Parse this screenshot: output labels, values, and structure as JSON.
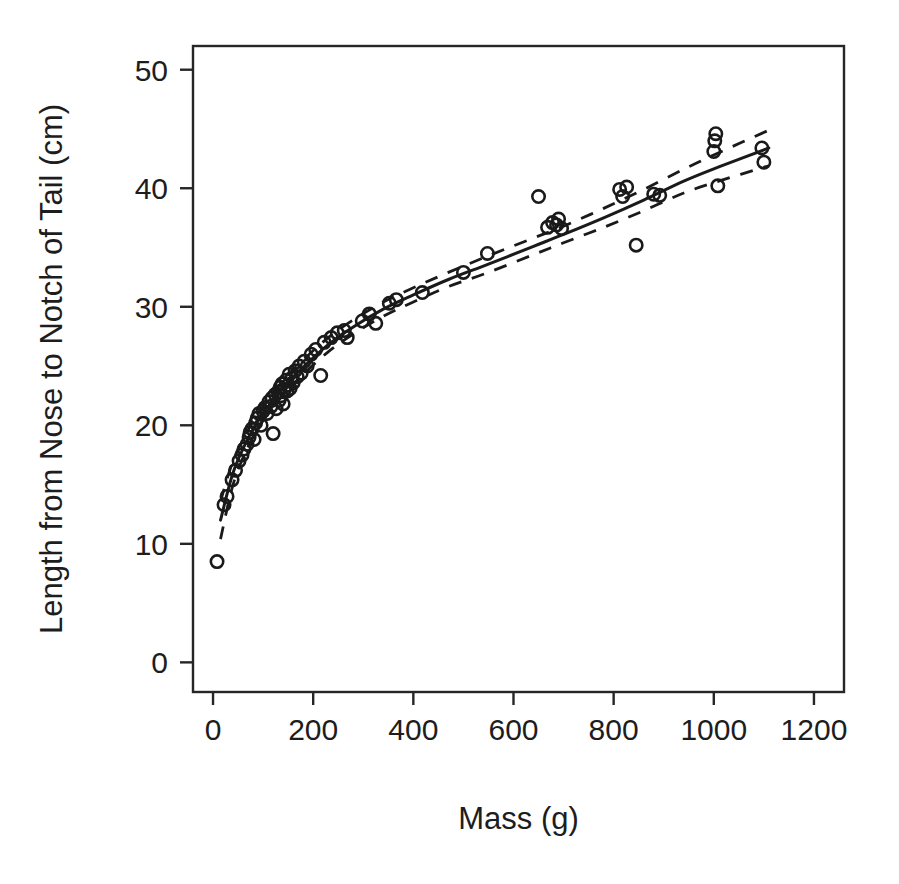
{
  "chart_data": {
    "type": "scatter",
    "title": "",
    "xlabel": "Mass (g)",
    "ylabel": "Length from Nose to Notch of Tail (cm)",
    "xlim": [
      -40,
      1260
    ],
    "ylim": [
      -2.5,
      52
    ],
    "xticks": [
      0,
      200,
      400,
      600,
      800,
      1000,
      1200
    ],
    "yticks": [
      0,
      10,
      20,
      30,
      40,
      50
    ],
    "grid": false,
    "legend": null,
    "point_marker": "open-circle",
    "series": [
      {
        "name": "observations",
        "type": "scatter",
        "points": [
          [
            8,
            8.5
          ],
          [
            22,
            13.3
          ],
          [
            28,
            14.0
          ],
          [
            38,
            15.4
          ],
          [
            45,
            16.2
          ],
          [
            52,
            17.0
          ],
          [
            58,
            17.5
          ],
          [
            62,
            18.0
          ],
          [
            68,
            18.4
          ],
          [
            72,
            19.0
          ],
          [
            74,
            19.4
          ],
          [
            78,
            19.7
          ],
          [
            82,
            18.8
          ],
          [
            85,
            20.2
          ],
          [
            88,
            20.6
          ],
          [
            92,
            21.0
          ],
          [
            96,
            20.0
          ],
          [
            100,
            21.2
          ],
          [
            104,
            21.5
          ],
          [
            108,
            21.0
          ],
          [
            112,
            22.0
          ],
          [
            116,
            21.6
          ],
          [
            118,
            22.3
          ],
          [
            120,
            19.3
          ],
          [
            124,
            22.6
          ],
          [
            126,
            21.4
          ],
          [
            130,
            22.8
          ],
          [
            132,
            22.1
          ],
          [
            134,
            23.2
          ],
          [
            136,
            22.5
          ],
          [
            138,
            23.5
          ],
          [
            140,
            21.8
          ],
          [
            142,
            23.0
          ],
          [
            146,
            23.8
          ],
          [
            148,
            22.9
          ],
          [
            150,
            23.4
          ],
          [
            152,
            24.3
          ],
          [
            154,
            23.1
          ],
          [
            158,
            24.0
          ],
          [
            160,
            23.6
          ],
          [
            164,
            24.6
          ],
          [
            168,
            24.1
          ],
          [
            172,
            25.0
          ],
          [
            176,
            24.4
          ],
          [
            182,
            25.4
          ],
          [
            188,
            25.0
          ],
          [
            196,
            26.0
          ],
          [
            205,
            26.4
          ],
          [
            215,
            24.2
          ],
          [
            222,
            27.0
          ],
          [
            236,
            27.4
          ],
          [
            248,
            27.8
          ],
          [
            262,
            28.0
          ],
          [
            268,
            27.4
          ],
          [
            298,
            28.8
          ],
          [
            312,
            29.4
          ],
          [
            325,
            28.6
          ],
          [
            352,
            30.3
          ],
          [
            366,
            30.6
          ],
          [
            418,
            31.2
          ],
          [
            500,
            32.9
          ],
          [
            548,
            34.5
          ],
          [
            650,
            39.3
          ],
          [
            668,
            36.7
          ],
          [
            678,
            37.1
          ],
          [
            686,
            36.9
          ],
          [
            690,
            37.4
          ],
          [
            696,
            36.6
          ],
          [
            812,
            39.9
          ],
          [
            818,
            39.3
          ],
          [
            826,
            40.1
          ],
          [
            845,
            35.2
          ],
          [
            880,
            39.5
          ],
          [
            892,
            39.4
          ],
          [
            1000,
            43.1
          ],
          [
            1002,
            44.0
          ],
          [
            1004,
            44.6
          ],
          [
            1008,
            40.2
          ],
          [
            1096,
            43.4
          ],
          [
            1100,
            42.2
          ]
        ]
      },
      {
        "name": "fitted-curve",
        "type": "line",
        "style": "solid",
        "points": [
          [
            15,
            12.0
          ],
          [
            40,
            16.0
          ],
          [
            70,
            18.9
          ],
          [
            100,
            21.0
          ],
          [
            140,
            23.2
          ],
          [
            180,
            24.9
          ],
          [
            230,
            26.8
          ],
          [
            280,
            28.3
          ],
          [
            340,
            29.8
          ],
          [
            400,
            31.0
          ],
          [
            470,
            32.3
          ],
          [
            550,
            33.6
          ],
          [
            640,
            35.1
          ],
          [
            700,
            36.1
          ],
          [
            780,
            37.5
          ],
          [
            860,
            39.0
          ],
          [
            940,
            40.6
          ],
          [
            1010,
            41.8
          ],
          [
            1110,
            43.4
          ]
        ]
      },
      {
        "name": "confidence-upper",
        "type": "line",
        "style": "dashed",
        "points": [
          [
            15,
            13.6
          ],
          [
            40,
            17.0
          ],
          [
            70,
            19.6
          ],
          [
            100,
            21.6
          ],
          [
            140,
            23.8
          ],
          [
            180,
            25.5
          ],
          [
            230,
            27.4
          ],
          [
            280,
            28.9
          ],
          [
            340,
            30.4
          ],
          [
            400,
            31.6
          ],
          [
            470,
            32.9
          ],
          [
            550,
            34.3
          ],
          [
            640,
            35.8
          ],
          [
            700,
            36.8
          ],
          [
            780,
            38.3
          ],
          [
            860,
            39.9
          ],
          [
            940,
            41.6
          ],
          [
            1010,
            43.0
          ],
          [
            1110,
            44.9
          ]
        ]
      },
      {
        "name": "confidence-lower",
        "type": "line",
        "style": "dashed",
        "points": [
          [
            15,
            10.4
          ],
          [
            40,
            15.0
          ],
          [
            70,
            18.2
          ],
          [
            100,
            20.4
          ],
          [
            140,
            22.6
          ],
          [
            180,
            24.3
          ],
          [
            230,
            26.2
          ],
          [
            280,
            27.7
          ],
          [
            340,
            29.2
          ],
          [
            400,
            30.4
          ],
          [
            470,
            31.7
          ],
          [
            550,
            32.9
          ],
          [
            640,
            34.4
          ],
          [
            700,
            35.4
          ],
          [
            780,
            36.7
          ],
          [
            860,
            38.1
          ],
          [
            940,
            39.6
          ],
          [
            1010,
            40.6
          ],
          [
            1110,
            41.9
          ]
        ]
      }
    ]
  }
}
